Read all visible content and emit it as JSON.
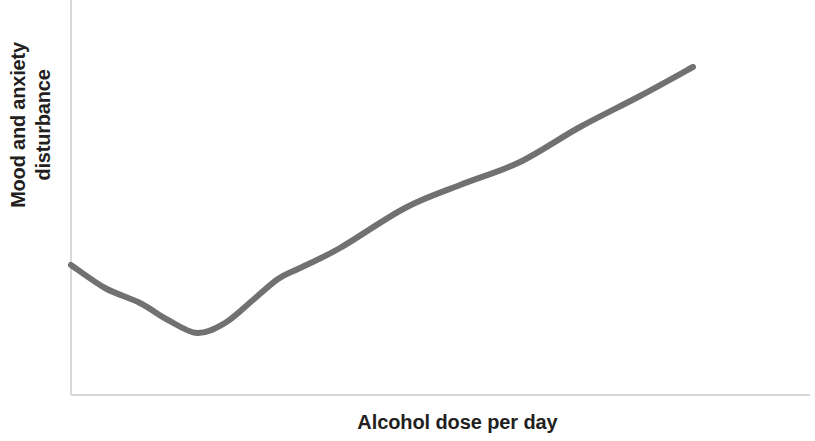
{
  "chart_data": {
    "type": "line",
    "title": "",
    "subtitle": "",
    "xlabel": "Alcohol dose per day",
    "ylabel_line1": "Mood and anxiety",
    "ylabel_line2": "disturbance",
    "ylabel": "Mood and anxiety disturbance",
    "legend": [],
    "legend_position": "none",
    "grid": false,
    "xticks": [],
    "yticks": [],
    "xtick_labels": [],
    "ytick_labels": [],
    "xlim": [
      0,
      100
    ],
    "ylim": [
      0,
      100
    ],
    "annotations": [],
    "line_color": "#717171",
    "line_width": 6,
    "axis_color": "#d8d8d8",
    "label_color": "#231f20",
    "background_color": "#ffffff",
    "series": [
      {
        "name": "Mood and anxiety disturbance",
        "x": [
          0,
          5,
          10,
          15,
          17,
          20,
          25,
          28,
          31,
          34,
          40,
          50,
          60,
          70,
          80,
          84
        ],
        "values": [
          33,
          26,
          20,
          16,
          15,
          17,
          25,
          30,
          33,
          37,
          45,
          57,
          68,
          78,
          87,
          90
        ],
        "points_px": [
          [
            71,
            265
          ],
          [
            105,
            288
          ],
          [
            140,
            303
          ],
          [
            168,
            320
          ],
          [
            197,
            333
          ],
          [
            225,
            323
          ],
          [
            253,
            300
          ],
          [
            278,
            279
          ],
          [
            300,
            268
          ],
          [
            340,
            248
          ],
          [
            405,
            208
          ],
          [
            460,
            185
          ],
          [
            520,
            162
          ],
          [
            580,
            127
          ],
          [
            640,
            96
          ],
          [
            693,
            67
          ]
        ]
      }
    ]
  },
  "axes": {
    "y_axis_x_px": 71,
    "y_axis_top_px": 0,
    "y_axis_bottom_px": 395,
    "x_axis_y_px": 395,
    "x_axis_left_px": 71,
    "x_axis_right_px": 810
  }
}
